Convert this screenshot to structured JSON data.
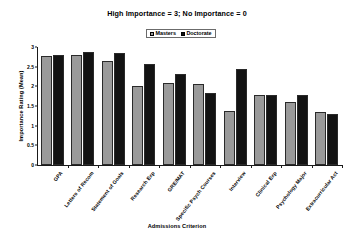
{
  "chart_data": {
    "type": "bar",
    "title": "High Importance = 3; No Importance = 0",
    "xlabel": "Admissions Criterion",
    "ylabel": "Importance Rating (Mean)",
    "ylim": [
      0,
      3
    ],
    "yticks": [
      "0",
      "0.5",
      "1",
      "1.5",
      "2",
      "2.5",
      "3"
    ],
    "ytick_values": [
      0,
      0.5,
      1,
      1.5,
      2,
      2.5,
      3
    ],
    "grid": false,
    "legend_position": "top-center",
    "categories": [
      "GPA",
      "Letters of Recom",
      "Statement of Goals",
      "Research Exp",
      "GRE/MAT",
      "Specific Psych Courses",
      "Interview",
      "Clinical Exp",
      "Psychology Major",
      "Extracurricular Act"
    ],
    "series": [
      {
        "name": "Masters",
        "color": "#9a9a9a",
        "values": [
          2.78,
          2.79,
          2.65,
          2.01,
          2.08,
          2.07,
          1.37,
          1.77,
          1.61,
          1.34
        ]
      },
      {
        "name": "Doctorate",
        "color": "#131313",
        "values": [
          2.8,
          2.87,
          2.86,
          2.56,
          2.32,
          1.82,
          2.43,
          1.79,
          1.77,
          1.29
        ]
      }
    ]
  },
  "legend": {
    "items": [
      {
        "label": "Masters"
      },
      {
        "label": "Doctorate"
      }
    ]
  },
  "colors": {
    "masters": "#9a9a9a",
    "doctorate": "#131313",
    "axis": "#1a1a1a",
    "background": "#ffffff"
  }
}
